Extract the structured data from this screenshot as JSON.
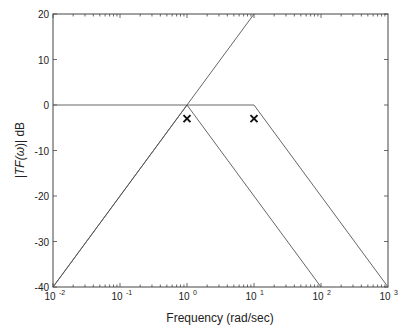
{
  "chart_data": {
    "type": "line",
    "title": "",
    "xlabel": "Frequency (rad/sec)",
    "ylabel": "|TF(ω)| dB",
    "xscale": "log",
    "xlim": [
      0.01,
      1000
    ],
    "ylim": [
      -40,
      20
    ],
    "grid": false,
    "legend": null,
    "x_ticks": [
      "10^-2",
      "10^-1",
      "10^0",
      "10^1",
      "10^2",
      "10^3"
    ],
    "y_ticks": [
      20,
      10,
      0,
      -10,
      -20,
      -30,
      -40
    ],
    "series": [
      {
        "name": "rising asymptote",
        "x": [
          0.01,
          10
        ],
        "y": [
          -40,
          20
        ]
      },
      {
        "name": "low-pass asymptote",
        "x": [
          0.01,
          10,
          1000
        ],
        "y": [
          0,
          0,
          -40
        ]
      },
      {
        "name": "band-pass asymptote",
        "x": [
          0.01,
          1,
          100
        ],
        "y": [
          -40,
          0,
          -40
        ]
      }
    ],
    "markers": [
      {
        "x": 1,
        "y": -3,
        "symbol": "x"
      },
      {
        "x": 10,
        "y": -3,
        "symbol": "x"
      }
    ]
  },
  "labels": {
    "xlabel": "Frequency (rad/sec)",
    "ylabel_main": "|TF(",
    "ylabel_omega": "ω",
    "ylabel_tail": ")| dB",
    "yticks": [
      "20",
      "10",
      "0",
      "-10",
      "-20",
      "-30",
      "-40"
    ],
    "xticks_base": "10",
    "xticks_exp": [
      "-2",
      "-1",
      "0",
      "1",
      "2",
      "3"
    ]
  }
}
